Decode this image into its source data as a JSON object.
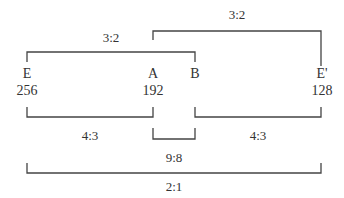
{
  "diagram": {
    "type": "interval-ratio-brackets",
    "nodes": [
      {
        "id": "E",
        "label": "E",
        "value": "256"
      },
      {
        "id": "A",
        "label": "A",
        "value": "192"
      },
      {
        "id": "B",
        "label": "B",
        "value": ""
      },
      {
        "id": "E_prime",
        "label": "E'",
        "value": "128"
      }
    ],
    "brackets": [
      {
        "id": "E-B",
        "ratio": "3:2",
        "position": "above"
      },
      {
        "id": "A-E_prime",
        "ratio": "3:2",
        "position": "above"
      },
      {
        "id": "E-A",
        "ratio": "4:3",
        "position": "below"
      },
      {
        "id": "B-E_prime",
        "ratio": "4:3",
        "position": "below"
      },
      {
        "id": "A-B",
        "ratio": "9:8",
        "position": "below"
      },
      {
        "id": "E-E_prime",
        "ratio": "2:1",
        "position": "below"
      }
    ],
    "line_color": "#444444"
  }
}
